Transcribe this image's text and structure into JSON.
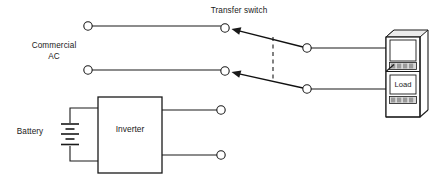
{
  "diagram": {
    "type": "electrical-schematic",
    "title": "",
    "background_color": "#ffffff",
    "line_color": "#1a1a1a",
    "labels": {
      "commercial_ac_line1": "Commercial",
      "commercial_ac_line2": "AC",
      "transfer_switch": "Transfer switch",
      "battery": "Battery",
      "inverter": "Inverter",
      "load": "Load"
    },
    "components": [
      {
        "name": "commercial-ac-source",
        "label": "Commercial AC",
        "kind": "source-terminals",
        "terminals": 2
      },
      {
        "name": "transfer-switch",
        "label": "Transfer switch",
        "kind": "double-throw-switch",
        "poles": 2,
        "mechanical_link": "dashed",
        "arm_direction": "arrow-left"
      },
      {
        "name": "load-cabinet",
        "label": "Load",
        "kind": "equipment-rack",
        "grille_count": 2,
        "grille_bars": 4
      },
      {
        "name": "inverter",
        "label": "Inverter",
        "kind": "rectangle-block"
      },
      {
        "name": "battery",
        "label": "Battery",
        "kind": "battery-symbol",
        "cells": 2
      }
    ],
    "connections": [
      {
        "from": "commercial-ac-source",
        "to": "transfer-switch",
        "conductor": "line-1"
      },
      {
        "from": "commercial-ac-source",
        "to": "transfer-switch",
        "conductor": "line-2"
      },
      {
        "from": "transfer-switch",
        "to": "load-cabinet",
        "conductor": "line-1"
      },
      {
        "from": "transfer-switch",
        "to": "load-cabinet",
        "conductor": "line-2"
      },
      {
        "from": "battery",
        "to": "inverter",
        "conductor": "dc-pair"
      },
      {
        "from": "inverter",
        "to": "open-terminals",
        "conductor": "ac-output-pair"
      }
    ]
  }
}
